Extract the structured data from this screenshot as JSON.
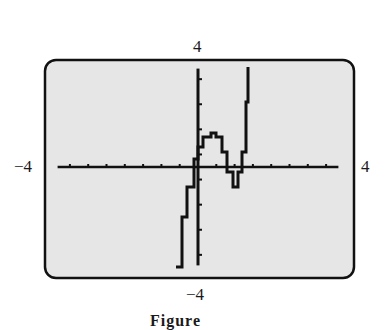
{
  "chart_data": {
    "type": "line",
    "title": "",
    "xlabel": "",
    "ylabel": "",
    "xlim": [
      -4,
      4
    ],
    "ylim": [
      -4,
      4
    ],
    "window_labels": {
      "ymax": "4",
      "ymin": "−4",
      "xmin": "−4",
      "xmax": "4"
    },
    "x_tick_step": 0.5,
    "y_tick_step": 0.5,
    "grid": false,
    "series": [
      {
        "name": "f(x)",
        "description": "cubic-like curve on graphing calculator screen: rising from bottom near x≈-0.6, local max ≈ (0.35, 1.3), local min ≈ (1.0, -0.8), rising off top near x≈1.4",
        "x": [
          -0.6,
          -0.45,
          -0.3,
          -0.1,
          0.0,
          0.15,
          0.35,
          0.5,
          0.65,
          0.8,
          0.95,
          1.0,
          1.1,
          1.2,
          1.3,
          1.37
        ],
        "y": [
          -4.0,
          -2.0,
          -0.8,
          0.3,
          0.8,
          1.2,
          1.35,
          1.2,
          0.6,
          -0.2,
          -0.8,
          -0.8,
          -0.2,
          0.6,
          2.6,
          4.0
        ]
      }
    ]
  },
  "labels": {
    "top": "4",
    "bottom": "−4",
    "left": "−4",
    "right": "4",
    "caption": "Figure"
  }
}
